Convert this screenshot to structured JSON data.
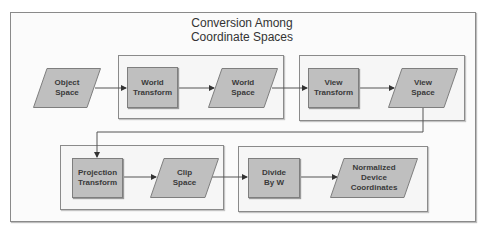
{
  "title": {
    "line1": "Conversion Among",
    "line2": "Coordinate Spaces"
  },
  "nodes": {
    "object_space": {
      "line1": "Object",
      "line2": "Space",
      "shape": "parallelogram"
    },
    "world_transform": {
      "line1": "World",
      "line2": "Transform",
      "shape": "rectangle"
    },
    "world_space": {
      "line1": "World",
      "line2": "Space",
      "shape": "parallelogram"
    },
    "view_transform": {
      "line1": "View",
      "line2": "Transform",
      "shape": "rectangle"
    },
    "view_space": {
      "line1": "View",
      "line2": "Space",
      "shape": "parallelogram"
    },
    "projection_transform": {
      "line1": "Projection",
      "line2": "Transform",
      "shape": "rectangle"
    },
    "clip_space": {
      "line1": "Clip",
      "line2": "Space",
      "shape": "parallelogram"
    },
    "divide_by_w": {
      "line1": "Divide",
      "line2": "By W",
      "shape": "rectangle"
    },
    "ndc": {
      "line1": "Normalized",
      "line2": "Device",
      "line3": "Coordinates",
      "shape": "parallelogram"
    }
  },
  "edges": [
    [
      "Object Space",
      "World Transform"
    ],
    [
      "World Transform",
      "World Space"
    ],
    [
      "World Space",
      "View Transform"
    ],
    [
      "View Transform",
      "View Space"
    ],
    [
      "View Space",
      "Projection Transform"
    ],
    [
      "Projection Transform",
      "Clip Space"
    ],
    [
      "Clip Space",
      "Divide By W"
    ],
    [
      "Divide By W",
      "Normalized Device Coordinates"
    ]
  ],
  "colors": {
    "node_fill": "#bfbfbf",
    "node_border": "#7e7e7e",
    "group_fill": "#f6f6f6",
    "line": "#555555"
  }
}
